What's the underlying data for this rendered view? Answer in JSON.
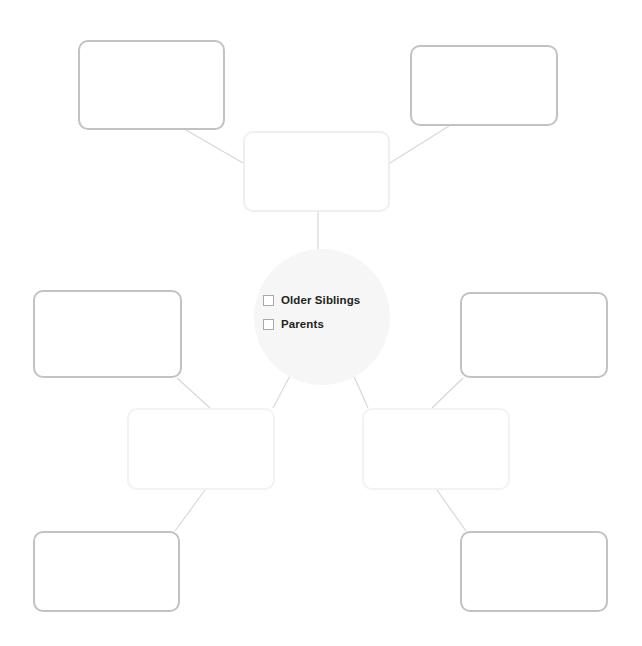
{
  "canvas": {
    "width": 642,
    "height": 646,
    "background": "#ffffff"
  },
  "colors": {
    "box_border_strong": "#c2c2c2",
    "box_border_faint": "#eef0f0",
    "hub_fill": "#f6f6f6",
    "connector": "#d8d8d8",
    "text": "#231f20",
    "checkbox_border": "#a9a9a9"
  },
  "hub": {
    "name": "center-hub",
    "shape": "circle",
    "cx": 322,
    "cy": 317,
    "r": 68,
    "options": [
      {
        "label": "Older Siblings",
        "checked": false
      },
      {
        "label": "Parents",
        "checked": false
      }
    ]
  },
  "boxes": [
    {
      "id": "top-left",
      "label": "",
      "x": 78,
      "y": 40,
      "w": 147,
      "h": 90,
      "border": "strong"
    },
    {
      "id": "top-right",
      "label": "",
      "x": 410,
      "y": 45,
      "w": 148,
      "h": 81,
      "border": "strong"
    },
    {
      "id": "top-center",
      "label": "",
      "x": 243,
      "y": 131,
      "w": 147,
      "h": 81,
      "border": "faint"
    },
    {
      "id": "mid-left",
      "label": "",
      "x": 33,
      "y": 290,
      "w": 149,
      "h": 88,
      "border": "strong"
    },
    {
      "id": "mid-right",
      "label": "",
      "x": 460,
      "y": 292,
      "w": 148,
      "h": 86,
      "border": "strong"
    },
    {
      "id": "lower-left-inner",
      "label": "",
      "x": 127,
      "y": 408,
      "w": 148,
      "h": 82,
      "border": "pale"
    },
    {
      "id": "lower-right-inner",
      "label": "",
      "x": 362,
      "y": 408,
      "w": 148,
      "h": 82,
      "border": "pale"
    },
    {
      "id": "bottom-left",
      "label": "",
      "x": 33,
      "y": 531,
      "w": 147,
      "h": 81,
      "border": "strong"
    },
    {
      "id": "bottom-right",
      "label": "",
      "x": 460,
      "y": 531,
      "w": 148,
      "h": 81,
      "border": "strong"
    }
  ],
  "connectors": [
    {
      "from": "top-left",
      "to": "top-center",
      "x1": 186,
      "y1": 130,
      "x2": 243,
      "y2": 163
    },
    {
      "from": "top-right",
      "to": "top-center",
      "x1": 449,
      "y1": 126,
      "x2": 390,
      "y2": 163
    },
    {
      "from": "top-center",
      "to": "center-hub",
      "x1": 318,
      "y1": 212,
      "x2": 318,
      "y2": 252
    },
    {
      "from": "center-hub",
      "to": "lower-left-inner",
      "x1": 292,
      "y1": 372,
      "x2": 273,
      "y2": 408
    },
    {
      "from": "center-hub",
      "to": "lower-right-inner",
      "x1": 352,
      "y1": 372,
      "x2": 368,
      "y2": 408
    },
    {
      "from": "mid-left",
      "to": "lower-left-inner",
      "x1": 177,
      "y1": 378,
      "x2": 210,
      "y2": 408
    },
    {
      "from": "mid-right",
      "to": "lower-right-inner",
      "x1": 463,
      "y1": 378,
      "x2": 432,
      "y2": 408
    },
    {
      "from": "lower-left-inner",
      "to": "bottom-left",
      "x1": 205,
      "y1": 490,
      "x2": 175,
      "y2": 531
    },
    {
      "from": "lower-right-inner",
      "to": "bottom-right",
      "x1": 437,
      "y1": 490,
      "x2": 466,
      "y2": 531
    }
  ]
}
